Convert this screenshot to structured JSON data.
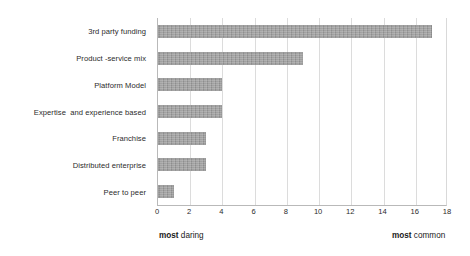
{
  "chart_data": {
    "type": "bar",
    "orientation": "horizontal",
    "title": "",
    "subtitle": "",
    "xlabel": "",
    "ylabel": "",
    "categories": [
      "3rd party funding",
      "Product -service mix",
      "Platform Model",
      "Expertise  and experience based",
      "Franchise",
      "Distributed enterprise",
      "Peer to peer"
    ],
    "values": [
      17,
      9,
      4,
      4,
      3,
      3,
      1
    ],
    "xlim": [
      0,
      18
    ],
    "xtick_labels": [
      "0",
      "2",
      "4",
      "6",
      "8",
      "10",
      "12",
      "14",
      "16",
      "18"
    ],
    "xtick_values": [
      0,
      2,
      4,
      6,
      8,
      10,
      12,
      14,
      16,
      18
    ],
    "grid": true,
    "grid_axis": "x",
    "legend": false,
    "bar_color": "#9c9c9c",
    "gridline_color": "#dcdcdc",
    "axis_color": "#b9b9b9",
    "annotations": [
      {
        "text": "most daring",
        "emphasis": "most",
        "rest": " daring",
        "position": "bottom-left"
      },
      {
        "text": "most common",
        "emphasis": "most",
        "rest": " common",
        "position": "bottom-right"
      }
    ]
  }
}
